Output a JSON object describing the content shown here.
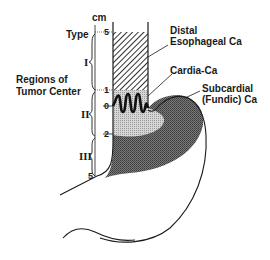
{
  "diagram": {
    "axis": {
      "unit": "cm",
      "title": "Type",
      "ticks": [
        "5",
        "1",
        "0",
        "2",
        "5"
      ]
    },
    "regions_label": [
      "Regions of",
      "Tumor Center"
    ],
    "regions": [
      "I",
      "II",
      "III"
    ],
    "callouts": {
      "distal": [
        "Distal",
        "Esophageal Ca"
      ],
      "cardia": "Cardia-Ca",
      "subcardial": [
        "Subcardial",
        "(Fundic) Ca"
      ]
    },
    "colors": {
      "line": "#1a1a1a",
      "hatch": "#555555",
      "light_fill": "#c8c8c8",
      "dark_fill": "#6e6e6e"
    }
  }
}
